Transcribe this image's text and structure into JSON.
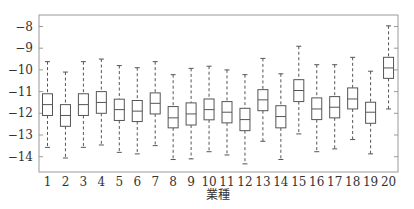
{
  "chart_data": {
    "type": "boxplot",
    "title": "",
    "xlabel": "業種",
    "ylabel": "",
    "categories": [
      "1",
      "2",
      "3",
      "4",
      "5",
      "6",
      "7",
      "8",
      "9",
      "10",
      "11",
      "12",
      "13",
      "14",
      "15",
      "16",
      "17",
      "18",
      "19",
      "20"
    ],
    "yticks": [
      -8,
      -9,
      -10,
      -11,
      -12,
      -13,
      -14
    ],
    "ytick_labels": [
      "−8",
      "−9",
      "−10",
      "−11",
      "−12",
      "−13",
      "−14"
    ],
    "ylim": [
      -14.75,
      -7.5
    ],
    "grid": false,
    "legend": null,
    "boxes": [
      {
        "label": "1",
        "whisker_high": -9.62,
        "q3": -11.1,
        "median": -11.6,
        "q1": -12.1,
        "whisker_low": -13.57
      },
      {
        "label": "2",
        "whisker_high": -10.1,
        "q3": -11.6,
        "median": -12.1,
        "q1": -12.6,
        "whisker_low": -14.06
      },
      {
        "label": "3",
        "whisker_high": -9.62,
        "q3": -11.1,
        "median": -11.6,
        "q1": -12.1,
        "whisker_low": -13.57
      },
      {
        "label": "4",
        "whisker_high": -9.5,
        "q3": -11.0,
        "median": -11.5,
        "q1": -12.0,
        "whisker_low": -13.46
      },
      {
        "label": "5",
        "whisker_high": -9.8,
        "q3": -11.35,
        "median": -11.83,
        "q1": -12.33,
        "whisker_low": -13.8
      },
      {
        "label": "6",
        "whisker_high": -9.9,
        "q3": -11.41,
        "median": -11.9,
        "q1": -12.38,
        "whisker_low": -13.87
      },
      {
        "label": "7",
        "whisker_high": -9.62,
        "q3": -11.06,
        "median": -11.54,
        "q1": -12.03,
        "whisker_low": -13.49
      },
      {
        "label": "8",
        "whisker_high": -10.22,
        "q3": -11.69,
        "median": -12.21,
        "q1": -12.67,
        "whisker_low": -14.13
      },
      {
        "label": "9",
        "whisker_high": -9.93,
        "q3": -11.52,
        "median": -12.03,
        "q1": -12.54,
        "whisker_low": -14.1
      },
      {
        "label": "10",
        "whisker_high": -9.83,
        "q3": -11.34,
        "median": -11.83,
        "q1": -12.3,
        "whisker_low": -13.77
      },
      {
        "label": "11",
        "whisker_high": -10.0,
        "q3": -11.46,
        "median": -11.95,
        "q1": -12.44,
        "whisker_low": -13.92
      },
      {
        "label": "12",
        "whisker_high": -10.22,
        "q3": -11.77,
        "median": -12.29,
        "q1": -12.8,
        "whisker_low": -14.33
      },
      {
        "label": "13",
        "whisker_high": -9.47,
        "q3": -10.91,
        "median": -11.38,
        "q1": -11.88,
        "whisker_low": -13.29
      },
      {
        "label": "14",
        "whisker_high": -10.18,
        "q3": -11.65,
        "median": -12.15,
        "q1": -12.67,
        "whisker_low": -14.13
      },
      {
        "label": "15",
        "whisker_high": -8.91,
        "q3": -10.45,
        "median": -10.95,
        "q1": -11.46,
        "whisker_low": -12.95
      },
      {
        "label": "16",
        "whisker_high": -9.76,
        "q3": -11.29,
        "median": -11.8,
        "q1": -12.29,
        "whisker_low": -13.77
      },
      {
        "label": "17",
        "whisker_high": -9.76,
        "q3": -11.23,
        "median": -11.72,
        "q1": -12.21,
        "whisker_low": -13.64
      },
      {
        "label": "18",
        "whisker_high": -9.42,
        "q3": -10.83,
        "median": -11.34,
        "q1": -11.8,
        "whisker_low": -13.21
      },
      {
        "label": "19",
        "whisker_high": -10.06,
        "q3": -11.49,
        "median": -11.95,
        "q1": -12.46,
        "whisker_low": -13.87
      },
      {
        "label": "20",
        "whisker_high": -7.97,
        "q3": -9.42,
        "median": -9.91,
        "q1": -10.39,
        "whisker_low": -11.8
      }
    ],
    "colors": {
      "frame": "#9a9a9a",
      "box": "#555555",
      "whisker": "#555555",
      "text": "#333333"
    }
  }
}
